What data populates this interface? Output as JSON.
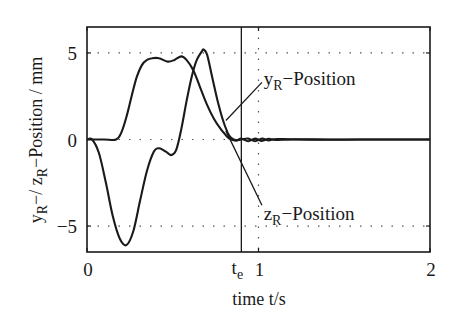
{
  "chart_data": {
    "type": "line",
    "title": "",
    "xlabel": "time t/s",
    "ylabel": "yR−/ zR−Position / mm",
    "xlim": [
      0,
      2
    ],
    "ylim": [
      -6.5,
      6.5
    ],
    "grid": "dotted",
    "x_ticks": [
      {
        "value": 0,
        "label": "0"
      },
      {
        "value": 1,
        "label": "1"
      },
      {
        "value": 2,
        "label": "2"
      }
    ],
    "y_ticks": [
      {
        "value": 5,
        "label": "5"
      },
      {
        "value": 0,
        "label": "0"
      },
      {
        "value": -5,
        "label": "−5"
      }
    ],
    "vertical_marker": {
      "value": 0.9,
      "label_main": "t",
      "label_sub": "e"
    },
    "series": [
      {
        "name": "yR-Position",
        "label_main": "y",
        "label_sub": "R",
        "label_suffix": "−Position",
        "x": [
          0,
          0.1,
          0.17,
          0.2,
          0.23,
          0.26,
          0.29,
          0.32,
          0.35,
          0.38,
          0.42,
          0.47,
          0.51,
          0.55,
          0.58,
          0.62,
          0.66,
          0.7,
          0.74,
          0.78,
          0.81,
          0.83,
          0.86,
          0.9,
          0.94,
          0.98,
          1.02,
          1.06,
          1.1,
          1.2,
          1.4,
          1.6,
          1.8,
          2.0
        ],
        "y": [
          0,
          0,
          0,
          0.4,
          1.3,
          2.5,
          3.6,
          4.3,
          4.6,
          4.7,
          4.7,
          4.5,
          4.6,
          4.8,
          4.6,
          4.0,
          3.0,
          2.0,
          1.2,
          0.6,
          0.25,
          0.05,
          -0.05,
          0.0,
          0.05,
          -0.1,
          0.05,
          -0.05,
          0.03,
          0.0,
          -0.02,
          0.0,
          0.0,
          0.0
        ]
      },
      {
        "name": "zR-Position",
        "label_main": "z",
        "label_sub": "R",
        "label_suffix": "−Position",
        "x": [
          0,
          0.03,
          0.07,
          0.11,
          0.15,
          0.19,
          0.23,
          0.27,
          0.31,
          0.35,
          0.39,
          0.42,
          0.46,
          0.49,
          0.52,
          0.55,
          0.58,
          0.61,
          0.64,
          0.67,
          0.68,
          0.7,
          0.73,
          0.76,
          0.79,
          0.82,
          0.84,
          0.87,
          0.9,
          0.94,
          0.98,
          1.02,
          1.06,
          1.1,
          1.2,
          1.4,
          1.6,
          1.8,
          2.0
        ],
        "y": [
          0,
          0,
          -0.8,
          -2.5,
          -4.4,
          -5.7,
          -6.1,
          -5.3,
          -3.5,
          -1.8,
          -0.7,
          -0.5,
          -0.7,
          -0.9,
          -0.6,
          0.6,
          2.2,
          3.6,
          4.6,
          5.1,
          5.2,
          4.9,
          3.6,
          2.3,
          1.2,
          0.4,
          0.1,
          -0.05,
          0.05,
          -0.1,
          0.05,
          -0.08,
          0.04,
          -0.03,
          0.02,
          0.0,
          0.0,
          0.0,
          0.0
        ]
      }
    ],
    "annotations": [
      {
        "target": "yR-Position",
        "text_x": 1.03,
        "text_y": 3.5,
        "pointer_from": [
          1.02,
          3.3
        ],
        "pointer_to": [
          0.81,
          1.1
        ]
      },
      {
        "target": "zR-Position",
        "text_x": 1.03,
        "text_y": -4.3,
        "pointer_from": [
          1.02,
          -3.8
        ],
        "pointer_to": [
          0.81,
          0.5
        ]
      }
    ]
  }
}
